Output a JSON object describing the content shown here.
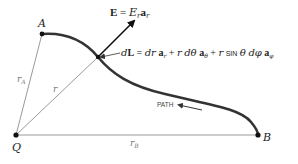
{
  "diagram": {
    "points": {
      "A": {
        "label": "A"
      },
      "Q": {
        "label": "Q"
      },
      "B": {
        "label": "B"
      }
    },
    "lines": {
      "rA": {
        "label_main": "r",
        "label_sub": "A"
      },
      "r": {
        "label": "r"
      },
      "rB": {
        "label_main": "r",
        "label_sub": "B"
      }
    },
    "field": {
      "lhs": "E",
      "eq": " = ",
      "rhs_main": "E",
      "rhs_sub": "r",
      "vec": "a",
      "vec_sub": "r"
    },
    "dL": {
      "lhs": "dL",
      "text": "dL = dr a_r + r dθ a_θ + r sin θ dφ a_φ",
      "parts": {
        "d": "d",
        "L": "L",
        "eq": " = ",
        "dr": "dr",
        "a": "a",
        "sub_r": "r",
        "plus": " + ",
        "r": "r",
        "dtheta": "dθ",
        "sub_theta": "θ",
        "sin": "SIN",
        "theta": "θ",
        "dphi": "dφ",
        "sub_phi": "φ"
      }
    },
    "path_label": "PATH",
    "colors": {
      "curve": "#333333",
      "thin_line": "#9a9a9a",
      "arrow": "#111111",
      "text": "#222222"
    }
  }
}
